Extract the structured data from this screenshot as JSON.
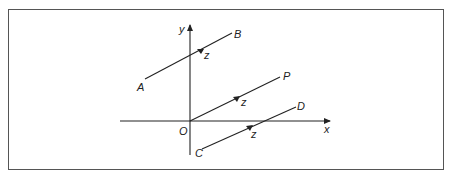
{
  "diagram": {
    "axes": {
      "x_label": "x",
      "y_label": "y",
      "origin_label": "O"
    },
    "segments": [
      {
        "id": "AB",
        "start_label": "A",
        "end_label": "B",
        "direction_label": "z"
      },
      {
        "id": "OP",
        "start_label": "O",
        "end_label": "P",
        "direction_label": "z"
      },
      {
        "id": "CD",
        "start_label": "C",
        "end_label": "D",
        "direction_label": "z"
      }
    ],
    "colors": {
      "line": "#222222",
      "frame": "#555555",
      "background": "#ffffff"
    }
  }
}
